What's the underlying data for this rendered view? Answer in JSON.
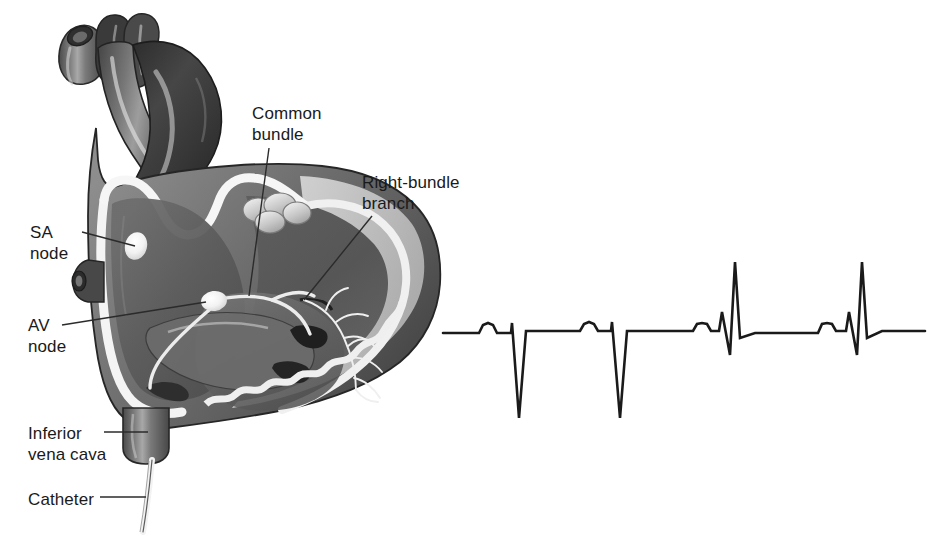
{
  "figure": {
    "background_color": "#ffffff",
    "line_color": "#1a1a1a"
  },
  "diagram": {
    "name": "heart-cross-section",
    "labels": [
      {
        "id": "sa-node",
        "text": "SA\nnode",
        "x": 30,
        "y": 222,
        "leader_from": [
          82,
          232
        ],
        "leader_to": [
          133,
          244
        ]
      },
      {
        "id": "av-node",
        "text": "AV\nnode",
        "x": 28,
        "y": 315,
        "leader_from": [
          62,
          325
        ],
        "leader_to": [
          214,
          301
        ]
      },
      {
        "id": "inferior-vena-cava",
        "text": "Inferior\nvena cava",
        "x": 28,
        "y": 423,
        "leader_from": [
          104,
          432
        ],
        "leader_to": [
          146,
          432
        ]
      },
      {
        "id": "catheter",
        "text": "Catheter",
        "x": 28,
        "y": 489,
        "leader_from": [
          100,
          497
        ],
        "leader_to": [
          143,
          497
        ]
      },
      {
        "id": "common-bundle",
        "text": "Common\nbundle",
        "x": 252,
        "y": 103,
        "leader_from": [
          268,
          148
        ],
        "leader_to": [
          251,
          295
        ]
      },
      {
        "id": "right-bundle-branch",
        "text": "Right-bundle\nbranch",
        "x": 362,
        "y": 172,
        "leader_from": [
          372,
          218
        ],
        "leader_to": [
          306,
          300
        ]
      }
    ],
    "structures": {
      "superior_vena_cava": "superior-vena-cava",
      "aorta": "aorta",
      "pulmonary_artery": "pulmonary-artery",
      "right_atrium": "right-atrium",
      "right_ventricle": "right-ventricle",
      "tricuspid_valve": "tricuspid-valve",
      "pulmonary_valve": "pulmonary-valve",
      "myocardium": "myocardium",
      "endocardium": "endocardium",
      "purkinje_fibers": "purkinje-fibers"
    },
    "palette": {
      "outer_wall": "#6f6f6f",
      "outer_wall_dark": "#4b4b4b",
      "chamber_dark": "#3a3a3a",
      "chamber_mid": "#5a5a5a",
      "chamber_light": "#7d7d7d",
      "endocardium": "#f2f2f2",
      "muscle_pale": "#c9c9c9",
      "highlight": "#ffffff",
      "outline": "#2a2a2a"
    }
  },
  "chart_data": {
    "type": "line",
    "name": "ecg-tracing",
    "title": "",
    "xlabel": "",
    "ylabel": "",
    "grid": false,
    "legend": false,
    "baseline_y": 333,
    "x_start": 443,
    "x_end": 925,
    "stroke_width": 2.6,
    "stroke_color": "#1a1a1a",
    "beats": [
      {
        "index": 1,
        "type": "paced-negative",
        "p_wave": {
          "start_x": 479,
          "peak_x": 488,
          "end_x": 497,
          "peak_y": 324
        },
        "qrs": {
          "onset_x": 511,
          "r_peak_x": 513,
          "r_peak_y": 323,
          "s_trough_x": 519,
          "s_trough_y": 418,
          "offset_x": 529,
          "st_y": 331
        }
      },
      {
        "index": 2,
        "type": "paced-negative",
        "p_wave": {
          "start_x": 580,
          "peak_x": 589,
          "end_x": 598,
          "peak_y": 324
        },
        "qrs": {
          "onset_x": 611,
          "r_peak_x": 613,
          "r_peak_y": 322,
          "s_trough_x": 620,
          "s_trough_y": 418,
          "offset_x": 630,
          "st_y": 331
        }
      },
      {
        "index": 3,
        "type": "conducted-positive",
        "p_wave": {
          "start_x": 693,
          "peak_x": 702,
          "end_x": 711,
          "peak_y": 324
        },
        "qrs": {
          "onset_x": 719,
          "r1_peak_x": 722,
          "r1_peak_y": 312,
          "q_trough_x": 730,
          "q_trough_y": 355,
          "r_peak_x": 735,
          "r_peak_y": 262,
          "s_x": 740,
          "s_y": 338,
          "offset_x": 755,
          "st_y": 333
        }
      },
      {
        "index": 4,
        "type": "conducted-positive",
        "p_wave": {
          "start_x": 818,
          "peak_x": 827,
          "end_x": 836,
          "peak_y": 324
        },
        "qrs": {
          "onset_x": 846,
          "r1_peak_x": 849,
          "r1_peak_y": 312,
          "q_trough_x": 857,
          "q_trough_y": 355,
          "r_peak_x": 862,
          "r_peak_y": 262,
          "s_x": 867,
          "s_y": 338,
          "offset_x": 882,
          "st_y": 331
        }
      }
    ],
    "points": [
      [
        443,
        333
      ],
      [
        479,
        333
      ],
      [
        483,
        325
      ],
      [
        488,
        323
      ],
      [
        493,
        325
      ],
      [
        497,
        333
      ],
      [
        511,
        333
      ],
      [
        512,
        323
      ],
      [
        519,
        418
      ],
      [
        526,
        331
      ],
      [
        529,
        331
      ],
      [
        530,
        331
      ],
      [
        580,
        331
      ],
      [
        584,
        324
      ],
      [
        589,
        322
      ],
      [
        594,
        324
      ],
      [
        598,
        331
      ],
      [
        611,
        331
      ],
      [
        612,
        322
      ],
      [
        620,
        418
      ],
      [
        627,
        331
      ],
      [
        630,
        331
      ],
      [
        693,
        331
      ],
      [
        697,
        324
      ],
      [
        702,
        323
      ],
      [
        707,
        324
      ],
      [
        711,
        331
      ],
      [
        719,
        331
      ],
      [
        722,
        312
      ],
      [
        730,
        355
      ],
      [
        735,
        262
      ],
      [
        740,
        338
      ],
      [
        755,
        333
      ],
      [
        818,
        333
      ],
      [
        822,
        324
      ],
      [
        827,
        323
      ],
      [
        832,
        324
      ],
      [
        836,
        331
      ],
      [
        846,
        331
      ],
      [
        849,
        312
      ],
      [
        857,
        355
      ],
      [
        862,
        262
      ],
      [
        867,
        338
      ],
      [
        882,
        331
      ],
      [
        925,
        331
      ]
    ]
  }
}
